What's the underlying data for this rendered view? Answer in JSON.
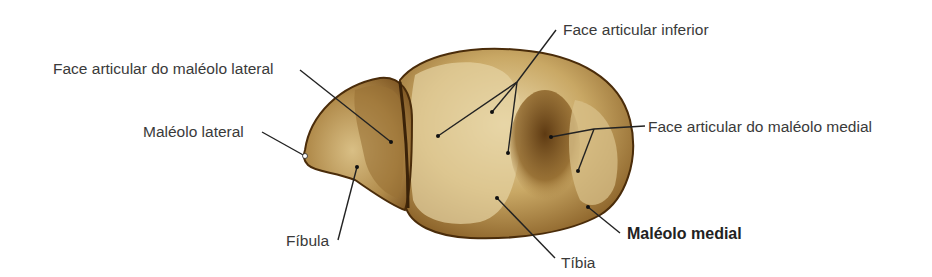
{
  "diagram": {
    "colors": {
      "bone_light": "#e8d6a6",
      "bone_mid": "#b48f4f",
      "bone_dark": "#6a4418",
      "outline": "#4a2c0a",
      "leader": "#222222",
      "text": "#3a3a3a"
    },
    "labels": [
      {
        "id": "face_articular_maleolo_lateral",
        "text": "Face articular do maléolo lateral",
        "bold": false
      },
      {
        "id": "maleolo_lateral",
        "text": "Maléolo lateral",
        "bold": false
      },
      {
        "id": "fibula",
        "text": "Fíbula",
        "bold": false
      },
      {
        "id": "face_articular_inferior",
        "text": "Face articular inferior",
        "bold": false
      },
      {
        "id": "face_articular_maleolo_medial",
        "text": "Face articular do maléolo medial",
        "bold": false
      },
      {
        "id": "maleolo_medial",
        "text": "Maléolo medial",
        "bold": true
      },
      {
        "id": "tibia",
        "text": "Tíbia",
        "bold": false
      }
    ]
  }
}
